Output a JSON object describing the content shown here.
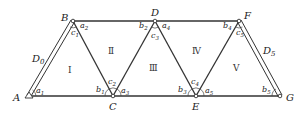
{
  "diagram": {
    "title": "",
    "nodes": [
      {
        "id": "A",
        "label": "A",
        "x": 29,
        "y": 96
      },
      {
        "id": "B",
        "label": "B",
        "x": 73,
        "y": 21
      },
      {
        "id": "C",
        "label": "C",
        "x": 113,
        "y": 96
      },
      {
        "id": "D",
        "label": "D",
        "x": 155,
        "y": 21
      },
      {
        "id": "E",
        "label": "E",
        "x": 196,
        "y": 96
      },
      {
        "id": "F",
        "label": "F",
        "x": 239,
        "y": 21
      },
      {
        "id": "G",
        "label": "G",
        "x": 280,
        "y": 96
      }
    ],
    "edges": [
      {
        "from": "A",
        "to": "B",
        "style": "double",
        "label": "D0"
      },
      {
        "from": "B",
        "to": "C",
        "style": "single"
      },
      {
        "from": "C",
        "to": "D",
        "style": "single"
      },
      {
        "from": "D",
        "to": "E",
        "style": "single"
      },
      {
        "from": "E",
        "to": "F",
        "style": "single"
      },
      {
        "from": "F",
        "to": "G",
        "style": "double",
        "label": "D5"
      },
      {
        "from": "A",
        "to": "G",
        "style": "single"
      },
      {
        "from": "B",
        "to": "F",
        "style": "single"
      }
    ],
    "node_labels": {
      "A": "A",
      "B": "B",
      "C": "C",
      "D": "D",
      "E": "E",
      "F": "F",
      "G": "G"
    },
    "side_labels": {
      "d0_main": "D",
      "d0_sub": "0",
      "d5_main": "D",
      "d5_sub": "5"
    },
    "triangles": [
      {
        "id": "I",
        "label": "Ⅰ"
      },
      {
        "id": "II",
        "label": "Ⅱ"
      },
      {
        "id": "III",
        "label": "Ⅲ"
      },
      {
        "id": "IV",
        "label": "Ⅳ"
      },
      {
        "id": "V",
        "label": "Ⅴ"
      }
    ],
    "angles": {
      "a1": {
        "main": "a",
        "sub": "1"
      },
      "a2": {
        "main": "a",
        "sub": "2"
      },
      "a3": {
        "main": "a",
        "sub": "3"
      },
      "a4": {
        "main": "a",
        "sub": "4"
      },
      "a5": {
        "main": "a",
        "sub": "5"
      },
      "b1": {
        "main": "b",
        "sub": "1"
      },
      "b2": {
        "main": "b",
        "sub": "2"
      },
      "b3": {
        "main": "b",
        "sub": "3"
      },
      "b4": {
        "main": "b",
        "sub": "4"
      },
      "b5": {
        "main": "b",
        "sub": "5"
      },
      "c1": {
        "main": "c",
        "sub": "1"
      },
      "c2": {
        "main": "c",
        "sub": "2"
      },
      "c3": {
        "main": "c",
        "sub": "3"
      },
      "c4": {
        "main": "c",
        "sub": "4"
      },
      "c5": {
        "main": "c",
        "sub": "5"
      }
    }
  }
}
